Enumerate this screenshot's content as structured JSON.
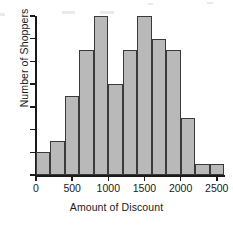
{
  "figure": {
    "background_color": "#ffffff",
    "bar_fill_color": "#b9b9b9",
    "bar_edge_color": "#3a3a3a",
    "axis_color": "#1a1a1a"
  },
  "chart_data": {
    "type": "bar",
    "title": "",
    "xlabel": "Amount of Discount",
    "ylabel": "Number of Shoppers",
    "grid": false,
    "legend": null,
    "xlim": [
      0,
      2600
    ],
    "ylim": [
      0,
      14
    ],
    "bin_width": 200,
    "bin_edges": [
      0,
      200,
      400,
      600,
      800,
      1000,
      1200,
      1400,
      1600,
      1800,
      2000,
      2200,
      2400,
      2600
    ],
    "categories": [
      "0-200",
      "200-400",
      "400-600",
      "600-800",
      "800-1000",
      "1000-1200",
      "1200-1400",
      "1400-1600",
      "1600-1800",
      "1800-2000",
      "2000-2200",
      "2200-2400",
      "2400-2600"
    ],
    "values": [
      2,
      3,
      7,
      11,
      14,
      8,
      11,
      14,
      12,
      11,
      5,
      1,
      1
    ],
    "xticks": [
      0,
      500,
      1000,
      1500,
      2000,
      2500
    ],
    "xtick_labels": [
      "0",
      "500",
      "1000",
      "1500",
      "2000",
      "2500"
    ],
    "yticks": [
      0,
      2,
      4,
      6,
      8,
      10,
      12,
      14
    ],
    "ytick_labels": [
      "0",
      "2",
      "4",
      "6",
      "8",
      "10",
      "12",
      "14"
    ]
  }
}
